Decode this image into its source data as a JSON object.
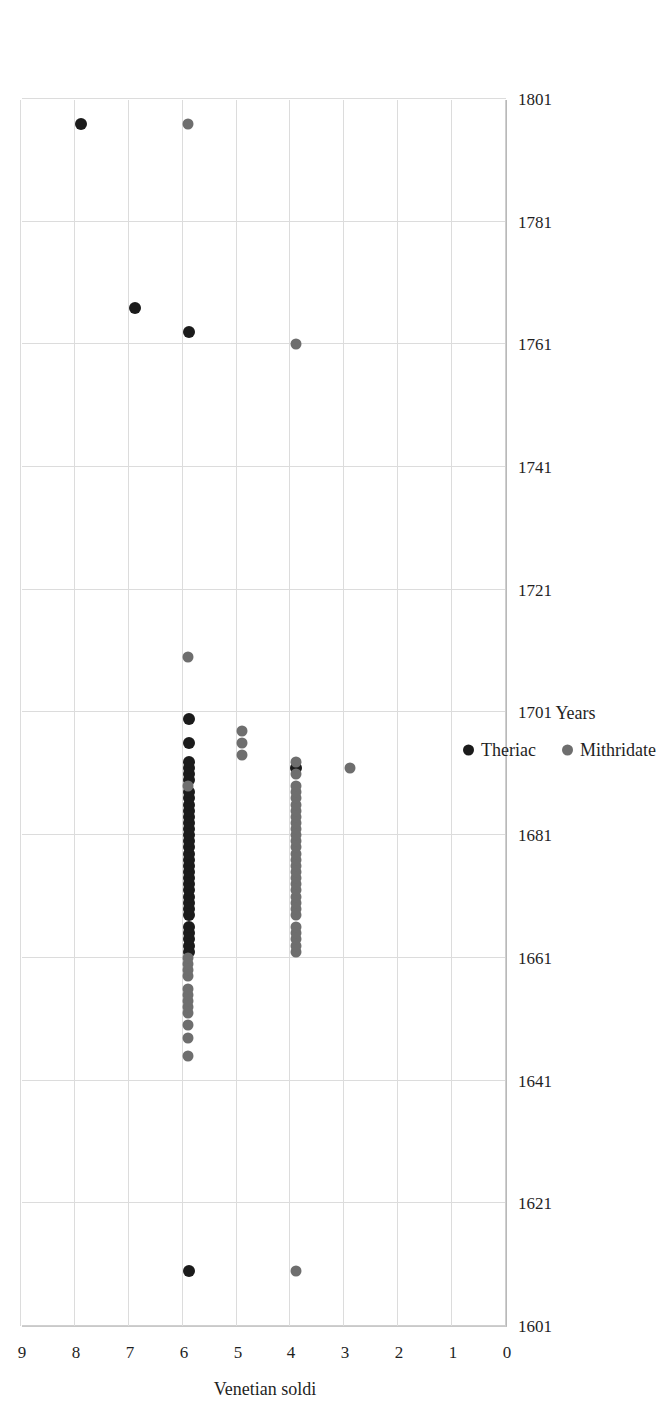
{
  "chart_data": {
    "type": "scatter",
    "title": "",
    "xlabel": "Years",
    "ylabel": "Venetian soldi",
    "xlim": [
      1601,
      1801
    ],
    "ylim": [
      0,
      9
    ],
    "xticks": [
      1601,
      1621,
      1641,
      1661,
      1681,
      1701,
      1721,
      1741,
      1761,
      1781,
      1801
    ],
    "yticks": [
      0,
      1,
      2,
      3,
      4,
      5,
      6,
      7,
      8,
      9
    ],
    "grid": true,
    "y_axis_reversed_on_screen": true,
    "rotation_degrees": -90,
    "legend_position": "bottom",
    "series": [
      {
        "name": "Theriac",
        "color": "#1b1b1b",
        "points": [
          [
            1610,
            6
          ],
          [
            1662,
            6
          ],
          [
            1663,
            6
          ],
          [
            1664,
            6
          ],
          [
            1665,
            6
          ],
          [
            1666,
            6
          ],
          [
            1668,
            6
          ],
          [
            1669,
            6
          ],
          [
            1670,
            6
          ],
          [
            1671,
            6
          ],
          [
            1672,
            6
          ],
          [
            1673,
            6
          ],
          [
            1674,
            6
          ],
          [
            1675,
            6
          ],
          [
            1676,
            6
          ],
          [
            1677,
            6
          ],
          [
            1678,
            6
          ],
          [
            1679,
            6
          ],
          [
            1680,
            6
          ],
          [
            1681,
            6
          ],
          [
            1682,
            6
          ],
          [
            1683,
            6
          ],
          [
            1684,
            6
          ],
          [
            1685,
            6
          ],
          [
            1686,
            6
          ],
          [
            1687,
            6
          ],
          [
            1688,
            6
          ],
          [
            1690,
            6
          ],
          [
            1691,
            6
          ],
          [
            1692,
            6
          ],
          [
            1693,
            6
          ],
          [
            1696,
            6
          ],
          [
            1692,
            4
          ],
          [
            1763,
            6
          ],
          [
            1767,
            7
          ],
          [
            1797,
            8
          ],
          [
            1700,
            6
          ]
        ]
      },
      {
        "name": "Mithridate",
        "color": "#6e6e6e",
        "points": [
          [
            1610,
            4
          ],
          [
            1645,
            6
          ],
          [
            1648,
            6
          ],
          [
            1650,
            6
          ],
          [
            1652,
            6
          ],
          [
            1653,
            6
          ],
          [
            1654,
            6
          ],
          [
            1655,
            6
          ],
          [
            1656,
            6
          ],
          [
            1658,
            6
          ],
          [
            1659,
            6
          ],
          [
            1660,
            6
          ],
          [
            1661,
            6
          ],
          [
            1662,
            4
          ],
          [
            1663,
            4
          ],
          [
            1664,
            4
          ],
          [
            1665,
            4
          ],
          [
            1666,
            4
          ],
          [
            1668,
            4
          ],
          [
            1669,
            4
          ],
          [
            1670,
            4
          ],
          [
            1671,
            4
          ],
          [
            1672,
            4
          ],
          [
            1673,
            4
          ],
          [
            1674,
            4
          ],
          [
            1675,
            4
          ],
          [
            1676,
            4
          ],
          [
            1677,
            4
          ],
          [
            1678,
            4
          ],
          [
            1679,
            4
          ],
          [
            1680,
            4
          ],
          [
            1681,
            4
          ],
          [
            1682,
            4
          ],
          [
            1683,
            4
          ],
          [
            1684,
            4
          ],
          [
            1685,
            4
          ],
          [
            1686,
            4
          ],
          [
            1687,
            4
          ],
          [
            1688,
            4
          ],
          [
            1689,
            4
          ],
          [
            1691,
            4
          ],
          [
            1693,
            4
          ],
          [
            1694,
            5
          ],
          [
            1696,
            5
          ],
          [
            1698,
            5
          ],
          [
            1692,
            3
          ],
          [
            1689,
            6
          ],
          [
            1710,
            6
          ],
          [
            1761,
            4
          ],
          [
            1797,
            6
          ]
        ]
      }
    ]
  },
  "axes": {
    "x_title": "Years",
    "y_title": "Venetian soldi",
    "x_tick_labels": [
      "1601",
      "1621",
      "1641",
      "1661",
      "1681",
      "1701",
      "1721",
      "1741",
      "1761",
      "1781",
      "1801"
    ],
    "y_tick_labels": [
      "0",
      "1",
      "2",
      "3",
      "4",
      "5",
      "6",
      "7",
      "8",
      "9"
    ]
  },
  "legend": {
    "items": [
      {
        "label": "Theriac",
        "marker": "filled-circle-icon",
        "color": "#1b1b1b"
      },
      {
        "label": "Mithridate",
        "marker": "filled-circle-icon",
        "color": "#6e6e6e"
      }
    ]
  },
  "colors": {
    "theriac": "#1b1b1b",
    "mithridate": "#6e6e6e",
    "grid": "#dcdcdc",
    "axis": "#b9b9b9",
    "text": "#1f1f1f",
    "background": "#ffffff"
  }
}
